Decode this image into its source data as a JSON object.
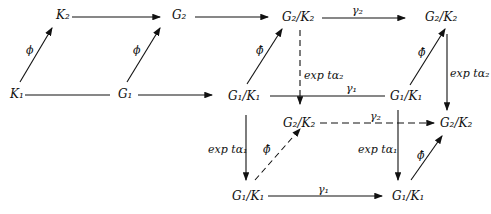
{
  "diagram": {
    "type": "commutative-diagram",
    "nodes": {
      "K2": "K₂",
      "G2": "G₂",
      "G2K2_top": "G₂/K₂",
      "G2K2_topright": "G₂/K₂",
      "K1": "K₁",
      "G1": "G₁",
      "G1K1_mid": "G₁/K₁",
      "G1K1_midright": "G₁/K₁",
      "G2K2_low": "G₂/K₂",
      "G2K2_lowright": "G₂/K₂",
      "G1K1_bottom": "G₁/K₁",
      "G1K1_bottomright": "G₁/K₁"
    },
    "labels": {
      "phi_left": "ϕ",
      "phi_mid": "ϕ",
      "phibar_mid": "ϕ̄",
      "phibar_right": "ϕ̄",
      "phibar_low": "ϕ̄",
      "phibar_lowright": "ϕ̄",
      "gamma2_top": "γ₂",
      "gamma1_mid": "γ₁",
      "gamma2_low": "γ₂",
      "gamma1_bottom": "γ₁",
      "exp_a2_mid": "exp tα₂",
      "exp_a2_right": "exp tα₂",
      "exp_a1_left": "exp tα₁",
      "exp_a1_right": "exp tα₁"
    }
  }
}
